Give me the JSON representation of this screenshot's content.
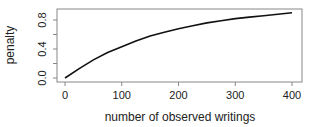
{
  "chart_data": {
    "type": "line",
    "title": "",
    "xlabel": "number of observed writings",
    "ylabel": "penalty",
    "xlim": [
      0,
      400
    ],
    "ylim": [
      0,
      0.9
    ],
    "xticks": [
      0,
      100,
      200,
      300,
      400
    ],
    "yticks": [
      "0.0",
      "0.4",
      "0.8"
    ],
    "yminor": [
      0.2,
      0.6
    ],
    "grid": false,
    "series": [
      {
        "name": "penalty",
        "x": [
          0,
          25,
          50,
          75,
          100,
          125,
          150,
          175,
          200,
          225,
          250,
          275,
          300,
          325,
          350,
          375,
          400
        ],
        "values": [
          0.0,
          0.13,
          0.25,
          0.35,
          0.43,
          0.51,
          0.58,
          0.63,
          0.68,
          0.72,
          0.76,
          0.79,
          0.82,
          0.84,
          0.86,
          0.88,
          0.9
        ]
      }
    ]
  }
}
